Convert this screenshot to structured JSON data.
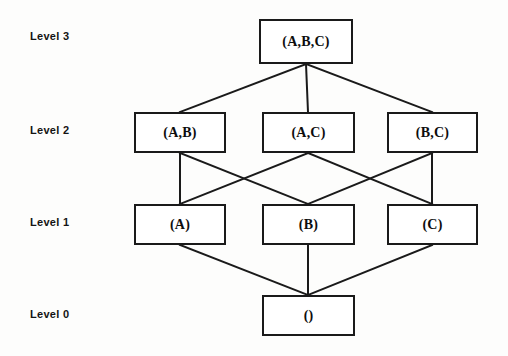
{
  "diagram": {
    "background_color": "#fdfdfc",
    "line_color": "#1a1a1a",
    "text_color": "#0d0d0d"
  },
  "level_labels": [
    {
      "id": "level-3",
      "text": "Level 3",
      "x": 30,
      "y": 30
    },
    {
      "id": "level-2",
      "text": "Level 2",
      "x": 30,
      "y": 124
    },
    {
      "id": "level-1",
      "text": "Level 1",
      "x": 30,
      "y": 216
    },
    {
      "id": "level-0",
      "text": "Level 0",
      "x": 30,
      "y": 308
    }
  ],
  "nodes": [
    {
      "id": "abc",
      "label": "(A,B,C)",
      "level": 3,
      "x": 259,
      "y": 19,
      "w": 94,
      "h": 45
    },
    {
      "id": "ab",
      "label": "(A,B)",
      "level": 2,
      "x": 134,
      "y": 112,
      "w": 92,
      "h": 41
    },
    {
      "id": "ac",
      "label": "(A,C)",
      "level": 2,
      "x": 262,
      "y": 112,
      "w": 93,
      "h": 41
    },
    {
      "id": "bc",
      "label": "(B,C)",
      "level": 2,
      "x": 387,
      "y": 112,
      "w": 91,
      "h": 41
    },
    {
      "id": "a",
      "label": "(A)",
      "level": 1,
      "x": 134,
      "y": 204,
      "w": 92,
      "h": 41
    },
    {
      "id": "b",
      "label": "(B)",
      "level": 1,
      "x": 262,
      "y": 204,
      "w": 93,
      "h": 41
    },
    {
      "id": "c",
      "label": "(C)",
      "level": 1,
      "x": 387,
      "y": 204,
      "w": 91,
      "h": 41
    },
    {
      "id": "empty",
      "label": "()",
      "level": 0,
      "x": 262,
      "y": 295,
      "w": 93,
      "h": 41
    }
  ],
  "edges": [
    {
      "from": "abc",
      "to": "ab",
      "x1": 306,
      "y1": 64,
      "x2": 180,
      "y2": 112
    },
    {
      "from": "abc",
      "to": "ac",
      "x1": 306,
      "y1": 64,
      "x2": 308,
      "y2": 112
    },
    {
      "from": "abc",
      "to": "bc",
      "x1": 306,
      "y1": 64,
      "x2": 432,
      "y2": 112
    },
    {
      "from": "ab",
      "to": "a",
      "x1": 180,
      "y1": 153,
      "x2": 180,
      "y2": 204
    },
    {
      "from": "ab",
      "to": "b",
      "x1": 180,
      "y1": 153,
      "x2": 308,
      "y2": 204
    },
    {
      "from": "ac",
      "to": "a",
      "x1": 308,
      "y1": 153,
      "x2": 180,
      "y2": 204
    },
    {
      "from": "ac",
      "to": "c",
      "x1": 308,
      "y1": 153,
      "x2": 432,
      "y2": 204
    },
    {
      "from": "bc",
      "to": "b",
      "x1": 432,
      "y1": 153,
      "x2": 308,
      "y2": 204
    },
    {
      "from": "bc",
      "to": "c",
      "x1": 432,
      "y1": 153,
      "x2": 432,
      "y2": 204
    },
    {
      "from": "a",
      "to": "empty",
      "x1": 180,
      "y1": 245,
      "x2": 308,
      "y2": 295
    },
    {
      "from": "b",
      "to": "empty",
      "x1": 308,
      "y1": 245,
      "x2": 308,
      "y2": 295
    },
    {
      "from": "c",
      "to": "empty",
      "x1": 432,
      "y1": 245,
      "x2": 308,
      "y2": 295
    }
  ]
}
